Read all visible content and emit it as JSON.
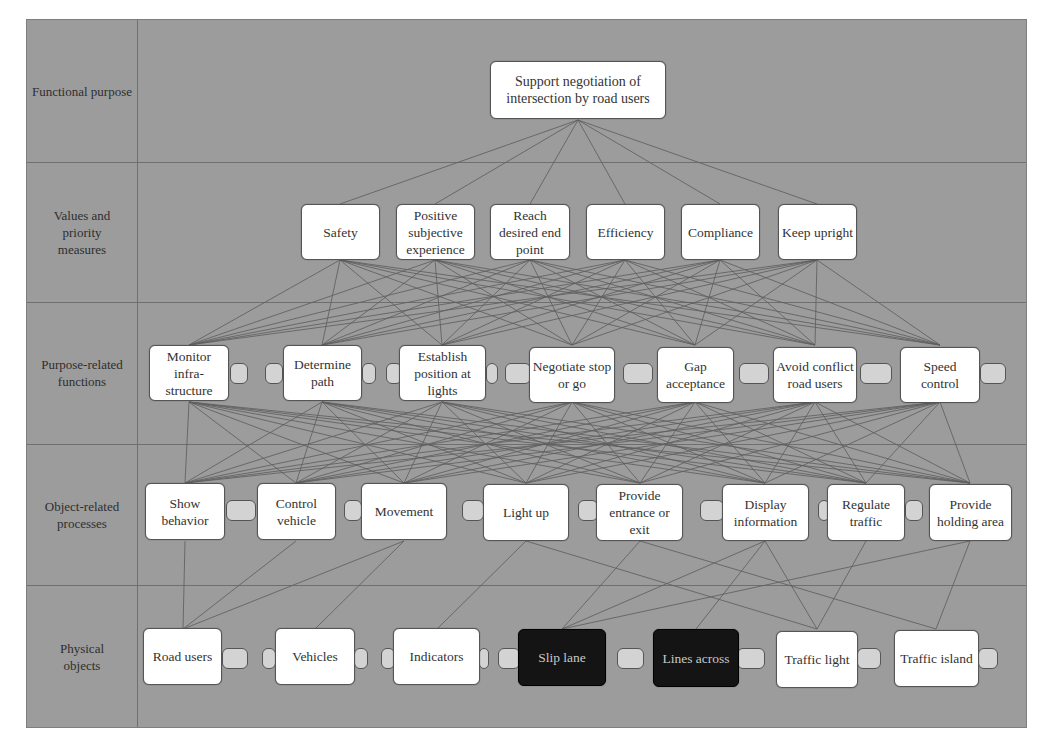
{
  "diagram": {
    "rows": [
      {
        "label": "Functional purpose"
      },
      {
        "label": "Values and priority measures"
      },
      {
        "label": "Purpose-related functions"
      },
      {
        "label": "Object-related processes"
      },
      {
        "label": "Physical objects"
      }
    ],
    "functional_purpose": [
      {
        "label": "Support negotiation of intersection by road users"
      }
    ],
    "values": [
      {
        "label": "Safety"
      },
      {
        "label": "Positive subjective experience"
      },
      {
        "label": "Reach desired end point"
      },
      {
        "label": "Efficiency"
      },
      {
        "label": "Compliance"
      },
      {
        "label": "Keep upright"
      }
    ],
    "functions": [
      {
        "label": "Monitor infra-structure"
      },
      {
        "label": "Determine path"
      },
      {
        "label": "Establish position at lights"
      },
      {
        "label": "Negotiate stop or go"
      },
      {
        "label": "Gap acceptance"
      },
      {
        "label": "Avoid conflict road users"
      },
      {
        "label": "Speed control"
      }
    ],
    "processes": [
      {
        "label": "Show behavior"
      },
      {
        "label": "Control vehicle"
      },
      {
        "label": "Movement"
      },
      {
        "label": "Light up"
      },
      {
        "label": "Provide entrance or exit"
      },
      {
        "label": "Display information"
      },
      {
        "label": "Regulate traffic"
      },
      {
        "label": "Provide holding area"
      }
    ],
    "objects": [
      {
        "label": "Road users",
        "highlighted": false
      },
      {
        "label": "Vehicles",
        "highlighted": false
      },
      {
        "label": "Indicators",
        "highlighted": false
      },
      {
        "label": "Slip lane",
        "highlighted": true
      },
      {
        "label": "Lines across",
        "highlighted": true
      },
      {
        "label": "Traffic light",
        "highlighted": false
      },
      {
        "label": "Traffic island",
        "highlighted": false
      }
    ],
    "colors": {
      "background": "#9c9c9c",
      "node": "#ffffff",
      "node_highlighted": "#141414",
      "edge": "#6a6a6a",
      "tab": "#d3d3d3"
    }
  }
}
